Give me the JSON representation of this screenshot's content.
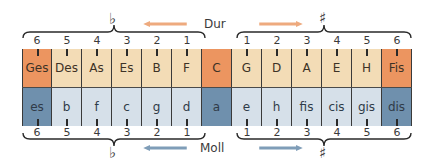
{
  "diagram": {
    "title_major": "Dur",
    "title_minor": "Moll",
    "flat_symbol": "♭",
    "sharp_symbol": "♯",
    "colors": {
      "major_light": "#f3dcb6",
      "major_strong": "#ec9560",
      "minor_light": "#d6e0e9",
      "minor_strong": "#6f90ad",
      "major_arrow": "#eeaa7e",
      "minor_arrow": "#7f9db8"
    },
    "flat_numbers": [
      "6",
      "5",
      "4",
      "3",
      "2",
      "1"
    ],
    "sharp_numbers": [
      "1",
      "2",
      "3",
      "4",
      "5",
      "6"
    ],
    "major_keys": [
      "Ges",
      "Des",
      "As",
      "Es",
      "B",
      "F",
      "C",
      "G",
      "D",
      "A",
      "E",
      "H",
      "Fis"
    ],
    "minor_keys": [
      "es",
      "b",
      "f",
      "c",
      "g",
      "d",
      "a",
      "e",
      "h",
      "fis",
      "cis",
      "gis",
      "dis"
    ]
  }
}
